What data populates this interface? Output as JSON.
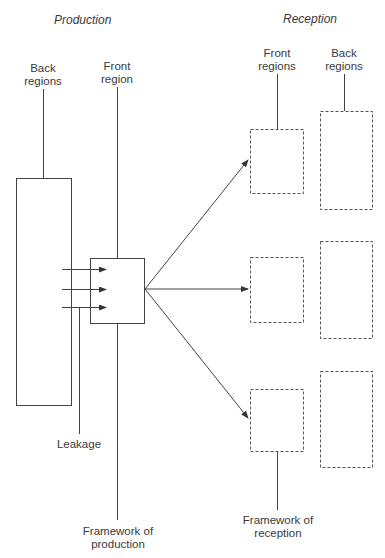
{
  "diagram": {
    "headers": {
      "production": "Production",
      "reception": "Reception"
    },
    "labels": {
      "back_regions_production": [
        "Back",
        "regions"
      ],
      "front_region_production": [
        "Front",
        "region"
      ],
      "front_regions_reception": [
        "Front",
        "regions"
      ],
      "back_regions_reception": [
        "Back",
        "regions"
      ],
      "leakage": "Leakage",
      "framework_production": [
        "Framework of",
        "production"
      ],
      "framework_reception": [
        "Framework of",
        "reception"
      ]
    },
    "colors": {
      "line": "#444444",
      "dashed": "#555555",
      "text": "#3a3a3a"
    }
  }
}
